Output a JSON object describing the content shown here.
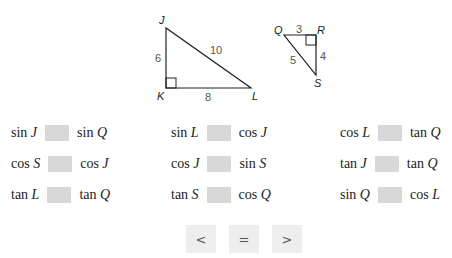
{
  "figure": {
    "triangle_jkl": {
      "vertices": [
        "J",
        "K",
        "L"
      ],
      "sides": {
        "JK": "6",
        "KL": "8",
        "JL": "10"
      },
      "right_angle_at": "K"
    },
    "triangle_qrs": {
      "vertices": [
        "Q",
        "R",
        "S"
      ],
      "sides": {
        "QR": "3",
        "RS": "4",
        "QS": "5"
      },
      "right_angle_at": "R"
    }
  },
  "comparisons": [
    {
      "left_fn": "sin",
      "left_var": "J",
      "right_fn": "sin",
      "right_var": "Q"
    },
    {
      "left_fn": "sin",
      "left_var": "L",
      "right_fn": "cos",
      "right_var": "J"
    },
    {
      "left_fn": "cos",
      "left_var": "L",
      "right_fn": "tan",
      "right_var": "Q"
    },
    {
      "left_fn": "cos",
      "left_var": "S",
      "right_fn": "cos",
      "right_var": "J"
    },
    {
      "left_fn": "cos",
      "left_var": "J",
      "right_fn": "sin",
      "right_var": "S"
    },
    {
      "left_fn": "tan",
      "left_var": "J",
      "right_fn": "tan",
      "right_var": "Q"
    },
    {
      "left_fn": "tan",
      "left_var": "L",
      "right_fn": "tan",
      "right_var": "Q"
    },
    {
      "left_fn": "tan",
      "left_var": "S",
      "right_fn": "cos",
      "right_var": "Q"
    },
    {
      "left_fn": "sin",
      "left_var": "Q",
      "right_fn": "cos",
      "right_var": "L"
    }
  ],
  "answer_buttons": [
    {
      "label": "<"
    },
    {
      "label": "="
    },
    {
      "label": ">"
    }
  ]
}
